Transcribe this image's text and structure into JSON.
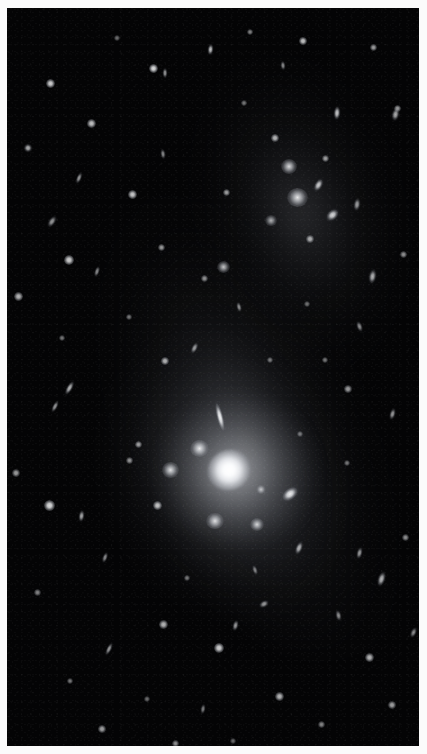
{
  "figure": {
    "kind": "astronomical-photograph",
    "width_px": 427,
    "height_px": 754,
    "border": {
      "color": "#fbfbfb",
      "left_px": 7,
      "top_px": 8,
      "right_px": 8,
      "bottom_px": 8
    },
    "sky_background_color": "#040405",
    "alt_text": "Deep greyscale astronomical image of a galaxy cluster. A bright central cD galaxy glows near the lower middle, surrounded by dozens of smaller elliptical and edge-on member galaxies, all embedded in a faint diffuse halo of intracluster light that runs diagonally from upper right to lower left across the black sky."
  },
  "structures": [
    {
      "name": "diffuse-halo-outer",
      "label": "extended intracluster light envelope",
      "center_x": 225,
      "center_y": 320,
      "position_angle_deg": -21
    },
    {
      "name": "diffuse-halo-north",
      "label": "northern halo extension",
      "center_x": 283,
      "center_y": 185,
      "position_angle_deg": -16
    },
    {
      "name": "diffuse-halo-inner",
      "label": "inner cD envelope",
      "center_x": 226,
      "center_y": 475,
      "position_angle_deg": -24
    },
    {
      "name": "bcg-core-glow",
      "label": "brightest cluster galaxy halo",
      "center_x": 230,
      "center_y": 463
    }
  ],
  "sources": [
    {
      "id": "bcg",
      "type": "nucleus",
      "x": 222,
      "y": 462,
      "w": 44,
      "h": 40,
      "rot": -28,
      "op": 1.0
    },
    {
      "id": "g001",
      "type": "fz",
      "x": 192,
      "y": 440,
      "w": 19,
      "h": 17,
      "rot": 0,
      "op": 0.95
    },
    {
      "id": "g002",
      "type": "fz",
      "x": 163,
      "y": 462,
      "w": 17,
      "h": 16,
      "rot": 0,
      "op": 0.92
    },
    {
      "id": "g003",
      "type": "el",
      "x": 213,
      "y": 409,
      "w": 8,
      "h": 36,
      "rot": -14,
      "op": 0.95
    },
    {
      "id": "g004",
      "type": "fz",
      "x": 208,
      "y": 513,
      "w": 18,
      "h": 16,
      "rot": 0,
      "op": 0.9
    },
    {
      "id": "g005",
      "type": "fz",
      "x": 250,
      "y": 516,
      "w": 14,
      "h": 13,
      "rot": 0,
      "op": 0.85
    },
    {
      "id": "g006",
      "type": "el",
      "x": 283,
      "y": 486,
      "w": 22,
      "h": 14,
      "rot": -38,
      "op": 0.93
    },
    {
      "id": "g007",
      "type": "fz",
      "x": 254,
      "y": 481,
      "w": 10,
      "h": 9,
      "rot": 0,
      "op": 0.7
    },
    {
      "id": "g008",
      "type": "pt",
      "x": 150,
      "y": 497,
      "w": 9,
      "h": 9,
      "rot": 0,
      "op": 0.75
    },
    {
      "id": "g009",
      "type": "pt",
      "x": 131,
      "y": 436,
      "w": 7,
      "h": 7,
      "rot": 0,
      "op": 0.6
    },
    {
      "id": "g010",
      "type": "el",
      "x": 292,
      "y": 540,
      "w": 8,
      "h": 16,
      "rot": 22,
      "op": 0.7
    },
    {
      "id": "g011",
      "type": "fz",
      "x": 290,
      "y": 189,
      "w": 21,
      "h": 19,
      "rot": 0,
      "op": 0.95
    },
    {
      "id": "g012",
      "type": "fz",
      "x": 282,
      "y": 158,
      "w": 16,
      "h": 15,
      "rot": 0,
      "op": 0.9
    },
    {
      "id": "g013",
      "type": "el",
      "x": 311,
      "y": 177,
      "w": 9,
      "h": 16,
      "rot": 30,
      "op": 0.8
    },
    {
      "id": "g014",
      "type": "el",
      "x": 325,
      "y": 207,
      "w": 17,
      "h": 12,
      "rot": -42,
      "op": 0.85
    },
    {
      "id": "g015",
      "type": "fz",
      "x": 264,
      "y": 212,
      "w": 12,
      "h": 11,
      "rot": 0,
      "op": 0.72
    },
    {
      "id": "g016",
      "type": "pt",
      "x": 303,
      "y": 231,
      "w": 8,
      "h": 8,
      "rot": 0,
      "op": 0.65
    },
    {
      "id": "g017",
      "type": "pt",
      "x": 318,
      "y": 150,
      "w": 7,
      "h": 7,
      "rot": 0,
      "op": 0.6
    },
    {
      "id": "g018",
      "type": "pt",
      "x": 268,
      "y": 130,
      "w": 8,
      "h": 8,
      "rot": 0,
      "op": 0.7
    },
    {
      "id": "g019",
      "type": "el",
      "x": 350,
      "y": 196,
      "w": 8,
      "h": 15,
      "rot": 8,
      "op": 0.62
    },
    {
      "id": "g020",
      "type": "fz",
      "x": 216,
      "y": 259,
      "w": 13,
      "h": 12,
      "rot": 0,
      "op": 0.82
    },
    {
      "id": "g021",
      "type": "pt",
      "x": 197,
      "y": 270,
      "w": 7,
      "h": 7,
      "rot": 0,
      "op": 0.55
    },
    {
      "id": "g022",
      "type": "pt",
      "x": 146,
      "y": 60,
      "w": 9,
      "h": 9,
      "rot": 0,
      "op": 0.85
    },
    {
      "id": "g023",
      "type": "el",
      "x": 203,
      "y": 41,
      "w": 7,
      "h": 13,
      "rot": 6,
      "op": 0.75
    },
    {
      "id": "g024",
      "type": "pt",
      "x": 43,
      "y": 75,
      "w": 9,
      "h": 9,
      "rot": 0,
      "op": 0.8
    },
    {
      "id": "g025",
      "type": "el",
      "x": 158,
      "y": 65,
      "w": 6,
      "h": 12,
      "rot": 0,
      "op": 0.6
    },
    {
      "id": "g026",
      "type": "pt",
      "x": 296,
      "y": 33,
      "w": 8,
      "h": 8,
      "rot": 0,
      "op": 0.75
    },
    {
      "id": "g027",
      "type": "pt",
      "x": 366,
      "y": 39,
      "w": 7,
      "h": 7,
      "rot": 0,
      "op": 0.6
    },
    {
      "id": "g028",
      "type": "el",
      "x": 276,
      "y": 57,
      "w": 6,
      "h": 11,
      "rot": -6,
      "op": 0.55
    },
    {
      "id": "g029",
      "type": "pt",
      "x": 243,
      "y": 24,
      "w": 6,
      "h": 6,
      "rot": 0,
      "op": 0.5
    },
    {
      "id": "g030",
      "type": "el",
      "x": 330,
      "y": 105,
      "w": 8,
      "h": 16,
      "rot": 4,
      "op": 0.8
    },
    {
      "id": "g031",
      "type": "pt",
      "x": 390,
      "y": 100,
      "w": 7,
      "h": 7,
      "rot": 0,
      "op": 0.6
    },
    {
      "id": "g032",
      "type": "el",
      "x": 388,
      "y": 106,
      "w": 9,
      "h": 15,
      "rot": 12,
      "op": 0.68
    },
    {
      "id": "g033",
      "type": "pt",
      "x": 84,
      "y": 115,
      "w": 9,
      "h": 9,
      "rot": 0,
      "op": 0.75
    },
    {
      "id": "g034",
      "type": "el",
      "x": 21,
      "y": 140,
      "w": 10,
      "h": 10,
      "rot": 0,
      "op": 0.7
    },
    {
      "id": "g035",
      "type": "el",
      "x": 72,
      "y": 170,
      "w": 6,
      "h": 14,
      "rot": 22,
      "op": 0.6
    },
    {
      "id": "g036",
      "type": "pt",
      "x": 125,
      "y": 186,
      "w": 9,
      "h": 9,
      "rot": 0,
      "op": 0.78
    },
    {
      "id": "g037",
      "type": "el",
      "x": 156,
      "y": 146,
      "w": 6,
      "h": 12,
      "rot": -8,
      "op": 0.55
    },
    {
      "id": "g038",
      "type": "pt",
      "x": 219,
      "y": 184,
      "w": 7,
      "h": 7,
      "rot": 0,
      "op": 0.6
    },
    {
      "id": "g039",
      "type": "el",
      "x": 45,
      "y": 213,
      "w": 8,
      "h": 15,
      "rot": 34,
      "op": 0.6
    },
    {
      "id": "g040",
      "type": "pt",
      "x": 62,
      "y": 252,
      "w": 10,
      "h": 10,
      "rot": 0,
      "op": 0.8
    },
    {
      "id": "g041",
      "type": "el",
      "x": 90,
      "y": 263,
      "w": 6,
      "h": 13,
      "rot": 18,
      "op": 0.55
    },
    {
      "id": "g042",
      "type": "pt",
      "x": 154,
      "y": 239,
      "w": 7,
      "h": 7,
      "rot": 0,
      "op": 0.58
    },
    {
      "id": "g043",
      "type": "el",
      "x": 232,
      "y": 299,
      "w": 6,
      "h": 12,
      "rot": -14,
      "op": 0.55
    },
    {
      "id": "g044",
      "type": "pt",
      "x": 158,
      "y": 353,
      "w": 8,
      "h": 8,
      "rot": 0,
      "op": 0.68
    },
    {
      "id": "g045",
      "type": "el",
      "x": 187,
      "y": 340,
      "w": 7,
      "h": 14,
      "rot": 26,
      "op": 0.6
    },
    {
      "id": "g046",
      "type": "el",
      "x": 62,
      "y": 380,
      "w": 7,
      "h": 18,
      "rot": 30,
      "op": 0.72
    },
    {
      "id": "g047",
      "type": "el",
      "x": 48,
      "y": 398,
      "w": 6,
      "h": 15,
      "rot": 28,
      "op": 0.6
    },
    {
      "id": "g048",
      "type": "pt",
      "x": 11,
      "y": 288,
      "w": 9,
      "h": 9,
      "rot": 0,
      "op": 0.7
    },
    {
      "id": "g049",
      "type": "pt",
      "x": 9,
      "y": 465,
      "w": 8,
      "h": 8,
      "rot": 0,
      "op": 0.6
    },
    {
      "id": "g050",
      "type": "pt",
      "x": 42,
      "y": 497,
      "w": 11,
      "h": 11,
      "rot": 0,
      "op": 0.85
    },
    {
      "id": "g051",
      "type": "el",
      "x": 74,
      "y": 508,
      "w": 7,
      "h": 14,
      "rot": 8,
      "op": 0.65
    },
    {
      "id": "g052",
      "type": "pt",
      "x": 122,
      "y": 452,
      "w": 7,
      "h": 7,
      "rot": 0,
      "op": 0.55
    },
    {
      "id": "g053",
      "type": "el",
      "x": 98,
      "y": 549,
      "w": 6,
      "h": 13,
      "rot": 20,
      "op": 0.55
    },
    {
      "id": "g054",
      "type": "pt",
      "x": 30,
      "y": 584,
      "w": 7,
      "h": 7,
      "rot": 0,
      "op": 0.5
    },
    {
      "id": "g055",
      "type": "el",
      "x": 365,
      "y": 268,
      "w": 9,
      "h": 17,
      "rot": 10,
      "op": 0.7
    },
    {
      "id": "g056",
      "type": "pt",
      "x": 396,
      "y": 246,
      "w": 7,
      "h": 7,
      "rot": 0,
      "op": 0.55
    },
    {
      "id": "g057",
      "type": "el",
      "x": 352,
      "y": 318,
      "w": 7,
      "h": 13,
      "rot": -20,
      "op": 0.55
    },
    {
      "id": "g058",
      "type": "pt",
      "x": 341,
      "y": 381,
      "w": 8,
      "h": 8,
      "rot": 0,
      "op": 0.6
    },
    {
      "id": "g059",
      "type": "el",
      "x": 385,
      "y": 406,
      "w": 7,
      "h": 14,
      "rot": 16,
      "op": 0.6
    },
    {
      "id": "g060",
      "type": "pt",
      "x": 318,
      "y": 352,
      "w": 6,
      "h": 6,
      "rot": 0,
      "op": 0.45
    },
    {
      "id": "g061",
      "type": "el",
      "x": 374,
      "y": 571,
      "w": 9,
      "h": 18,
      "rot": 18,
      "op": 0.72
    },
    {
      "id": "g062",
      "type": "el",
      "x": 352,
      "y": 545,
      "w": 7,
      "h": 14,
      "rot": 14,
      "op": 0.6
    },
    {
      "id": "g063",
      "type": "pt",
      "x": 398,
      "y": 529,
      "w": 7,
      "h": 7,
      "rot": 0,
      "op": 0.55
    },
    {
      "id": "g064",
      "type": "el",
      "x": 331,
      "y": 607,
      "w": 7,
      "h": 13,
      "rot": -12,
      "op": 0.55
    },
    {
      "id": "g065",
      "type": "pt",
      "x": 362,
      "y": 649,
      "w": 9,
      "h": 9,
      "rot": 0,
      "op": 0.7
    },
    {
      "id": "g066",
      "type": "pt",
      "x": 385,
      "y": 697,
      "w": 8,
      "h": 8,
      "rot": 0,
      "op": 0.62
    },
    {
      "id": "g067",
      "type": "el",
      "x": 406,
      "y": 624,
      "w": 7,
      "h": 13,
      "rot": 24,
      "op": 0.55
    },
    {
      "id": "g068",
      "type": "pt",
      "x": 212,
      "y": 640,
      "w": 10,
      "h": 10,
      "rot": 0,
      "op": 0.8
    },
    {
      "id": "g069",
      "type": "pt",
      "x": 156,
      "y": 616,
      "w": 9,
      "h": 9,
      "rot": 0,
      "op": 0.7
    },
    {
      "id": "g070",
      "type": "el",
      "x": 228,
      "y": 617,
      "w": 7,
      "h": 13,
      "rot": 14,
      "op": 0.6
    },
    {
      "id": "g071",
      "type": "el",
      "x": 257,
      "y": 596,
      "w": 12,
      "h": 8,
      "rot": -30,
      "op": 0.6
    },
    {
      "id": "g072",
      "type": "el",
      "x": 102,
      "y": 641,
      "w": 6,
      "h": 16,
      "rot": 26,
      "op": 0.6
    },
    {
      "id": "g073",
      "type": "pt",
      "x": 272,
      "y": 688,
      "w": 9,
      "h": 9,
      "rot": 0,
      "op": 0.7
    },
    {
      "id": "g074",
      "type": "pt",
      "x": 95,
      "y": 721,
      "w": 8,
      "h": 8,
      "rot": 0,
      "op": 0.62
    },
    {
      "id": "g075",
      "type": "pt",
      "x": 168,
      "y": 735,
      "w": 7,
      "h": 7,
      "rot": 0,
      "op": 0.55
    },
    {
      "id": "g076",
      "type": "pt",
      "x": 63,
      "y": 673,
      "w": 6,
      "h": 6,
      "rot": 0,
      "op": 0.45
    },
    {
      "id": "g077",
      "type": "el",
      "x": 196,
      "y": 701,
      "w": 6,
      "h": 12,
      "rot": 10,
      "op": 0.5
    },
    {
      "id": "g078",
      "type": "pt",
      "x": 314,
      "y": 716,
      "w": 7,
      "h": 7,
      "rot": 0,
      "op": 0.5
    },
    {
      "id": "g079",
      "type": "el",
      "x": 248,
      "y": 562,
      "w": 6,
      "h": 12,
      "rot": -18,
      "op": 0.5
    },
    {
      "id": "g080",
      "type": "pt",
      "x": 180,
      "y": 570,
      "w": 6,
      "h": 6,
      "rot": 0,
      "op": 0.45
    },
    {
      "id": "g081",
      "type": "pt",
      "x": 122,
      "y": 309,
      "w": 6,
      "h": 6,
      "rot": 0,
      "op": 0.45
    },
    {
      "id": "g082",
      "type": "pt",
      "x": 55,
      "y": 330,
      "w": 6,
      "h": 6,
      "rot": 0,
      "op": 0.45
    },
    {
      "id": "g083",
      "type": "pt",
      "x": 263,
      "y": 352,
      "w": 6,
      "h": 6,
      "rot": 0,
      "op": 0.45
    },
    {
      "id": "g084",
      "type": "pt",
      "x": 300,
      "y": 296,
      "w": 6,
      "h": 6,
      "rot": 0,
      "op": 0.42
    },
    {
      "id": "g085",
      "type": "pt",
      "x": 237,
      "y": 95,
      "w": 6,
      "h": 6,
      "rot": 0,
      "op": 0.45
    },
    {
      "id": "g086",
      "type": "pt",
      "x": 110,
      "y": 30,
      "w": 6,
      "h": 6,
      "rot": 0,
      "op": 0.42
    },
    {
      "id": "g087",
      "type": "pt",
      "x": 340,
      "y": 455,
      "w": 6,
      "h": 6,
      "rot": 0,
      "op": 0.45
    },
    {
      "id": "g088",
      "type": "pt",
      "x": 293,
      "y": 426,
      "w": 6,
      "h": 6,
      "rot": 0,
      "op": 0.42
    },
    {
      "id": "g089",
      "type": "pt",
      "x": 140,
      "y": 691,
      "w": 6,
      "h": 6,
      "rot": 0,
      "op": 0.42
    },
    {
      "id": "g090",
      "type": "pt",
      "x": 226,
      "y": 733,
      "w": 6,
      "h": 6,
      "rot": 0,
      "op": 0.4
    }
  ]
}
